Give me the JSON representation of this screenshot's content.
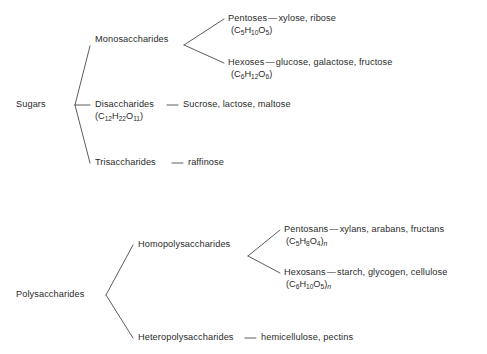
{
  "diagrams": [
    {
      "name": "sugars-classification",
      "root": "Sugars",
      "branches": [
        {
          "label": "Monosaccharides",
          "children": [
            {
              "label": "Pentoses",
              "separator": "—",
              "examples": "xylose, ribose",
              "formula": {
                "open": "(C",
                "sub1": "5",
                "h": "H",
                "sub2": "10",
                "o": "O",
                "sub3": "5",
                "close": ")"
              }
            },
            {
              "label": "Hexoses",
              "separator": "—",
              "examples": "glucose, galactose, fructose",
              "formula": {
                "open": "(C",
                "sub1": "6",
                "h": "H",
                "sub2": "12",
                "o": "O",
                "sub3": "6",
                "close": ")"
              }
            }
          ]
        },
        {
          "label": "Disaccharides",
          "separator": "—",
          "examples": "Sucrose, lactose, maltose",
          "formula": {
            "open": "(C",
            "sub1": "12",
            "h": "H",
            "sub2": "22",
            "o": "O",
            "sub3": "11",
            "close": ")"
          }
        },
        {
          "label": "Trisaccharides",
          "separator": "—",
          "examples": "raffinose"
        }
      ]
    },
    {
      "name": "polysaccharides-classification",
      "root": "Polysaccharides",
      "branches": [
        {
          "label": "Homopolysaccharides",
          "children": [
            {
              "label": "Pentosans",
              "separator": "—",
              "examples": "xylans, arabans, fructans",
              "formula": {
                "open": "(C",
                "sub1": "5",
                "h": "H",
                "sub2": "8",
                "o": "O",
                "sub3": "4",
                "close": ")",
                "n": "n"
              }
            },
            {
              "label": "Hexosans",
              "separator": "—",
              "examples": "starch, glycogen, cellulose",
              "formula": {
                "open": "(C",
                "sub1": "6",
                "h": "H",
                "sub2": "10",
                "o": "O",
                "sub3": "5",
                "close": ")",
                "n": "n"
              }
            }
          ]
        },
        {
          "label": "Heteropolysaccharides",
          "separator": "—",
          "examples": "hemicellulose, pectins"
        }
      ]
    }
  ],
  "style": {
    "line_color": "#4a4a4a",
    "text_color": "#2b2b2b",
    "background": "#ffffff"
  }
}
